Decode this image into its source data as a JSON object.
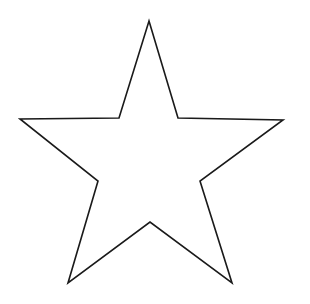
{
  "figure": {
    "kind": "line-drawing",
    "subject_name": "five-pointed-star",
    "canvas": {
      "width": 310,
      "height": 304,
      "background_color": "#ffffff"
    },
    "stroke": {
      "color": "#1a1a1a",
      "width": 1.6,
      "linejoin": "miter"
    },
    "fill_color": "#ffffff",
    "shape": {
      "type": "polygon",
      "point_count": 5,
      "closed": true,
      "vertices": [
        {
          "name": "top-apex",
          "kind": "outer",
          "x": 149,
          "y": 21
        },
        {
          "name": "upper-right-notch",
          "kind": "inner",
          "x": 178,
          "y": 118
        },
        {
          "name": "right-point",
          "kind": "outer",
          "x": 283,
          "y": 120
        },
        {
          "name": "lower-right-notch",
          "kind": "inner",
          "x": 200,
          "y": 181
        },
        {
          "name": "bottom-right-point",
          "kind": "outer",
          "x": 232,
          "y": 283
        },
        {
          "name": "bottom-notch",
          "kind": "inner",
          "x": 150,
          "y": 222
        },
        {
          "name": "bottom-left-point",
          "kind": "outer",
          "x": 68,
          "y": 283
        },
        {
          "name": "lower-left-notch",
          "kind": "inner",
          "x": 98,
          "y": 181
        },
        {
          "name": "left-point",
          "kind": "outer",
          "x": 20,
          "y": 119
        },
        {
          "name": "upper-left-notch",
          "kind": "inner",
          "x": 119,
          "y": 118
        }
      ],
      "path_points": "149,21 178,118 283,120 200,181 232,283 150,222 68,283 98,181 20,119 119,118"
    },
    "text_labels": [],
    "annotations": []
  }
}
